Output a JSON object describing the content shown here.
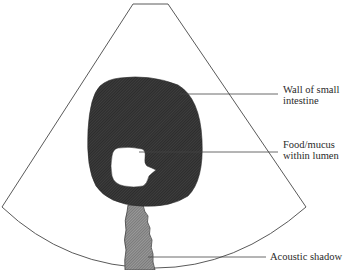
{
  "diagram": {
    "colors": {
      "outline": "#555555",
      "wall_fill": "#3a3a3a",
      "shadow_fill": "#8a8a8a",
      "lumen_fill": "#ffffff",
      "leader": "#444444",
      "text": "#2a2a2a"
    },
    "labels": [
      {
        "id": "wall",
        "line1": "Wall of small",
        "line2": "intestine"
      },
      {
        "id": "food",
        "line1": "Food/mucus",
        "line2": "within lumen"
      },
      {
        "id": "shadow",
        "line1": "Acoustic shadow"
      }
    ]
  }
}
